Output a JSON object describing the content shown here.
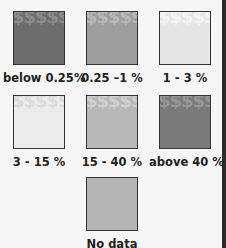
{
  "legend": {
    "items": [
      {
        "label": "below 0.25%",
        "fill": "#6e6e6e",
        "glyph": "#8c8c8c",
        "pattern": "dollar"
      },
      {
        "label": "0.25 –1 %",
        "fill": "#9e9e9e",
        "glyph": "#b9b9b9",
        "pattern": "dollar"
      },
      {
        "label": "1 - 3 %",
        "fill": "#e6e6e6",
        "glyph": "#f4f4f4",
        "pattern": "dollar"
      },
      {
        "label": "3 - 15 %",
        "fill": "#ececec",
        "glyph": "#dcdcdc",
        "pattern": "dollar"
      },
      {
        "label": "15 - 40 %",
        "fill": "#b8b8b8",
        "glyph": "#cfcfcf",
        "pattern": "dollar"
      },
      {
        "label": "above 40 %",
        "fill": "#7a7a7a",
        "glyph": "#969696",
        "pattern": "dollar"
      },
      {
        "label": "No data",
        "fill": "#b5b5b5",
        "glyph": null,
        "pattern": "none"
      }
    ],
    "pattern_glyph": "$$$$$$$$$$$$$$$$$$$$"
  }
}
